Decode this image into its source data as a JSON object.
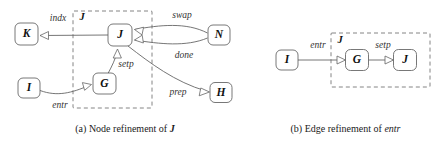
{
  "figure": {
    "width": 441,
    "height": 147,
    "background": "#ffffff",
    "line_color": "#666666",
    "node_stroke": "#555555",
    "dashed_stroke": "#777777",
    "text_color": "#111111"
  },
  "subfigure_a": {
    "caption_prefix": "(a)",
    "caption_text": "Node refinement of",
    "caption_symbol": "J",
    "container_label": "J",
    "nodes": [
      {
        "id": "K",
        "label": "K",
        "x": 26.5,
        "y": 34,
        "w": 23,
        "h": 22
      },
      {
        "id": "J",
        "label": "J",
        "x": 120,
        "y": 35,
        "w": 24,
        "h": 22
      },
      {
        "id": "G",
        "label": "G",
        "x": 104.5,
        "y": 83.5,
        "w": 23,
        "h": 21
      },
      {
        "id": "I",
        "label": "I",
        "x": 29,
        "y": 88,
        "w": 22,
        "h": 20
      },
      {
        "id": "N",
        "label": "N",
        "x": 219,
        "y": 35,
        "w": 22,
        "h": 20
      },
      {
        "id": "H",
        "label": "H",
        "x": 221,
        "y": 92.5,
        "w": 22,
        "h": 20
      }
    ],
    "edges": [
      {
        "id": "indx",
        "label": "indx",
        "from": "J",
        "to": "K",
        "label_x": 58,
        "label_y": 19
      },
      {
        "id": "swap",
        "label": "swap",
        "from": "N",
        "to": "J",
        "label_x": 182,
        "label_y": 16
      },
      {
        "id": "done",
        "label": "done",
        "from": "N",
        "to": "J",
        "label_x": 184,
        "label_y": 56
      },
      {
        "id": "setp",
        "label": "setp",
        "from": "G",
        "to": "J",
        "label_x": 126,
        "label_y": 65
      },
      {
        "id": "prep",
        "label": "prep",
        "from": "J",
        "to": "H",
        "label_x": 178,
        "label_y": 93
      },
      {
        "id": "entr",
        "label": "entr",
        "from": "I",
        "to": "G",
        "label_x": 60,
        "label_y": 106
      }
    ]
  },
  "subfigure_b": {
    "caption_prefix": "(b)",
    "caption_text": "Edge refinement of",
    "caption_symbol": "entr",
    "container_label": "J",
    "nodes": [
      {
        "id": "I",
        "label": "I",
        "x": 287,
        "y": 60,
        "w": 22,
        "h": 20
      },
      {
        "id": "G",
        "label": "G",
        "x": 357,
        "y": 60,
        "w": 23,
        "h": 21
      },
      {
        "id": "J",
        "label": "J",
        "x": 405,
        "y": 60,
        "w": 23,
        "h": 21
      }
    ],
    "edges": [
      {
        "id": "entr",
        "label": "entr",
        "from": "I",
        "to": "G",
        "label_x": 318,
        "label_y": 46
      },
      {
        "id": "setp",
        "label": "setp",
        "from": "G",
        "to": "J",
        "label_x": 383,
        "label_y": 46
      }
    ]
  }
}
